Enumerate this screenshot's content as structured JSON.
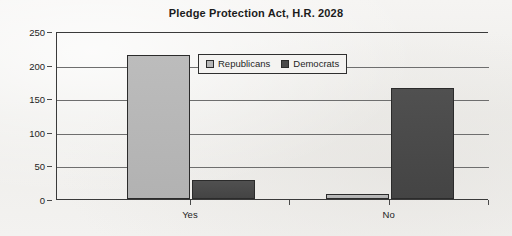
{
  "chart_data": {
    "type": "bar",
    "title": "Pledge Protection Act, H.R. 2028",
    "xlabel": "",
    "ylabel": "",
    "categories": [
      "Yes",
      "No"
    ],
    "series": [
      {
        "name": "Republicans",
        "color": "#b6b6b6",
        "values": [
          214,
          7
        ]
      },
      {
        "name": "Democrats",
        "color": "#4a4a4a",
        "values": [
          28,
          165
        ]
      }
    ],
    "ylim": [
      0,
      250
    ],
    "yticks": [
      0,
      50,
      100,
      150,
      200,
      250
    ],
    "ytick_labels": [
      "0",
      "50",
      "100",
      "150",
      "200",
      "250"
    ],
    "grid": true,
    "grid_axis": "y",
    "legend_position": "upper-center",
    "legend": [
      "Republicans",
      "Democrats"
    ]
  },
  "colors": {
    "background": "#f2f1ef",
    "axis": "#3a3a3a",
    "grid": "#6e6e6e",
    "text": "#1c1c1c",
    "republicans": "#b6b6b6",
    "democrats": "#4a4a4a"
  }
}
